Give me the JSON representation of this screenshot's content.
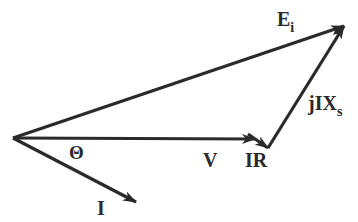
{
  "diagram": {
    "type": "phasor-diagram",
    "stroke_color": "#2a2a2a",
    "background": "#ffffff",
    "origin": [
      13,
      138
    ],
    "vectors": [
      {
        "id": "Ei",
        "from": [
          13,
          138
        ],
        "to": [
          344,
          26
        ]
      },
      {
        "id": "V",
        "from": [
          13,
          138
        ],
        "to": [
          255,
          139
        ]
      },
      {
        "id": "IR",
        "from": [
          255,
          139
        ],
        "to": [
          268,
          148
        ]
      },
      {
        "id": "jIXs",
        "from": [
          268,
          148
        ],
        "to": [
          344,
          26
        ]
      },
      {
        "id": "I",
        "from": [
          13,
          138
        ],
        "to": [
          136,
          202
        ]
      }
    ],
    "labels": {
      "ei_main": "E",
      "ei_sub": "i",
      "v": "V",
      "ir": "IR",
      "jixs_main": "jIX",
      "jixs_sub": "s",
      "i": "I",
      "theta": "Θ"
    }
  }
}
